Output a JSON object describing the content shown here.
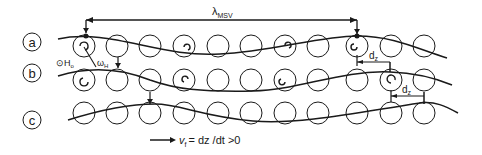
{
  "diagram": {
    "type": "magnetic-vortex-lattice-schematic",
    "colors": {
      "ink": "#1a1a1a",
      "background": "#ffffff"
    },
    "row_labels": [
      "a",
      "b",
      "c"
    ],
    "wavelength_label": "λ",
    "wavelength_subscript": "MSV",
    "field_label": "⊙H",
    "field_subscript": "o",
    "angle_label": "ω",
    "angle_subscript": "H",
    "displacement_label_a": "d",
    "displacement_sub_a": "z",
    "displacement_label_b": "d",
    "displacement_sub_b": "z",
    "velocity_expression": "v",
    "velocity_sub": "f",
    "velocity_rhs": "= dz /dt  >0",
    "rows": [
      {
        "label": "a",
        "circles": 11,
        "vortex_marks_at": [
          0,
          2,
          6,
          9
        ]
      },
      {
        "label": "b",
        "circles": 11,
        "vortex_marks_at": [
          0,
          2,
          6,
          9
        ]
      },
      {
        "label": "c",
        "circles": 11,
        "vortex_marks_at": []
      }
    ]
  }
}
